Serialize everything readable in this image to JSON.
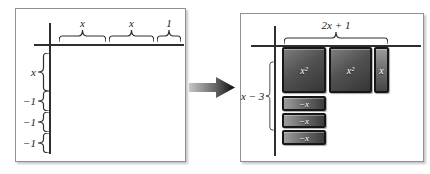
{
  "left_panel": {
    "top_braces": [
      {
        "label": "x"
      },
      {
        "label": "x"
      },
      {
        "label": "1"
      }
    ],
    "side_braces": [
      {
        "label": "x"
      },
      {
        "label": "−1"
      },
      {
        "label": "−1"
      },
      {
        "label": "−1"
      }
    ]
  },
  "right_panel": {
    "top_brace_label": "2x + 1",
    "side_brace_label": "x − 3",
    "tiles": [
      {
        "label": "x²",
        "type": "x-squared"
      },
      {
        "label": "x²",
        "type": "x-squared"
      },
      {
        "label": "x",
        "type": "x"
      },
      {
        "label": "−x",
        "type": "neg-x"
      },
      {
        "label": "−x",
        "type": "neg-x"
      },
      {
        "label": "−x",
        "type": "neg-x"
      }
    ]
  },
  "arrow": {
    "meaning": "transforms-to"
  },
  "colors": {
    "panel_border": "#909090",
    "axis_line": "#2e2e2e",
    "tile_border": "#161616",
    "tile_fill_dark": "#4a4a4a",
    "tile_label": "#ffffff",
    "label_text": "#1a1a1a"
  }
}
